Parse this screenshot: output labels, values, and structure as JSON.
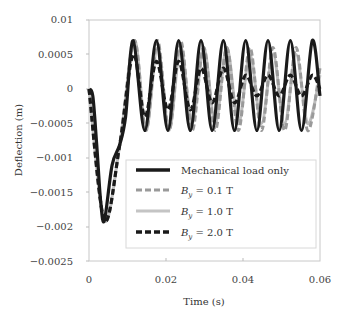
{
  "chart_data": {
    "type": "line",
    "title": "",
    "xlabel": "Time (s)",
    "ylabel": "Deflection (m)",
    "xlim": [
      0,
      0.06
    ],
    "ylim": [
      -0.0025,
      0.001
    ],
    "x_ticks": [
      "0",
      "0.02",
      "0.04",
      "0.06"
    ],
    "y_ticks": [
      "0.01",
      "0.0005",
      "0",
      "−0.0005",
      "−0.001",
      "−0.0015",
      "−0.002",
      "−0.0025"
    ],
    "grid": false,
    "legend_position": "lower right (inside plot)",
    "series": [
      {
        "name": "Mechanical load only",
        "style": "solid",
        "color": "#1a1a1a",
        "description": "Initial drop to about -0.0019 at t≈0.004, then steady oscillation between ≈+0.0007 and ≈-0.0006 with period ≈0.0058 s",
        "x": [
          0,
          0.001,
          0.002,
          0.003,
          0.004,
          0.006,
          0.008,
          0.0095,
          0.0115,
          0.0145,
          0.0175,
          0.0205,
          0.0233,
          0.0263,
          0.0291,
          0.032,
          0.0349,
          0.0378,
          0.0407,
          0.0436,
          0.0465,
          0.0494,
          0.0523,
          0.0552,
          0.058,
          0.06
        ],
        "values": [
          0,
          -0.0001,
          -0.0008,
          -0.0016,
          -0.0019,
          -0.0011,
          -0.0008,
          -0.0004,
          0.0007,
          -0.0006,
          0.0007,
          -0.0006,
          0.0007,
          -0.0006,
          0.0007,
          -0.0006,
          0.0007,
          -0.0006,
          0.0007,
          -0.0006,
          0.0007,
          -0.0006,
          0.0007,
          -0.0006,
          0.0007,
          -0.0001
        ]
      },
      {
        "name": "By = 0.1 T",
        "style": "dashed",
        "color": "#9a9a9a",
        "description": "Nearly coincides with mechanical load only, slight phase lag at later times",
        "x": [
          0,
          0.004,
          0.008,
          0.0118,
          0.0148,
          0.0178,
          0.0208,
          0.0238,
          0.0268,
          0.0298,
          0.0328,
          0.0358,
          0.0388,
          0.0418,
          0.0448,
          0.0478,
          0.0508,
          0.0538,
          0.0568,
          0.06
        ],
        "values": [
          0,
          -0.0019,
          -0.0008,
          0.0007,
          -0.0006,
          0.0007,
          -0.0006,
          0.0007,
          -0.0006,
          0.0006,
          -0.0006,
          0.0006,
          -0.0006,
          0.0006,
          -0.0006,
          0.0006,
          -0.0006,
          0.0006,
          -0.0006,
          0.0003
        ]
      },
      {
        "name": "By = 1.0 T",
        "style": "solid",
        "color": "#bdbdbd",
        "description": "Similar to 0.1 T, slightly damped amplitude",
        "x": [
          0,
          0.004,
          0.008,
          0.0118,
          0.0148,
          0.0178,
          0.0208,
          0.0238,
          0.0268,
          0.0298,
          0.0328,
          0.0358,
          0.0388,
          0.0418,
          0.0448,
          0.0478,
          0.0508,
          0.0538,
          0.0568,
          0.06
        ],
        "values": [
          0,
          -0.0019,
          -0.0008,
          0.0007,
          -0.0006,
          0.0006,
          -0.0006,
          0.0006,
          -0.0005,
          0.0006,
          -0.0005,
          0.0006,
          -0.0005,
          0.0005,
          -0.0005,
          0.0005,
          -0.0005,
          0.0005,
          -0.0005,
          0.0002
        ]
      },
      {
        "name": "By = 2.0 T",
        "style": "dashed",
        "color": "#1a1a1a",
        "description": "Strongly damped oscillation, amplitude decays toward ≈+0.0002/-0.0001 by t=0.06",
        "x": [
          0,
          0.004,
          0.008,
          0.0115,
          0.0145,
          0.0175,
          0.0205,
          0.0233,
          0.0263,
          0.0291,
          0.032,
          0.0349,
          0.0378,
          0.0407,
          0.0436,
          0.0465,
          0.0494,
          0.0523,
          0.0552,
          0.058,
          0.06
        ],
        "values": [
          0,
          -0.0019,
          -0.0008,
          0.0005,
          -0.0004,
          0.0004,
          -0.0003,
          0.0004,
          -0.0003,
          0.0003,
          -0.0002,
          0.0003,
          -0.0002,
          0.0002,
          -0.0001,
          0.0002,
          -0.0001,
          0.0002,
          -0.0001,
          0.0002,
          0.0
        ]
      }
    ]
  },
  "legend": {
    "items": [
      {
        "label": "Mechanical load only"
      },
      {
        "label_main": "B",
        "label_sub": "y",
        "label_rest": " = 0.1 T"
      },
      {
        "label_main": "B",
        "label_sub": "y",
        "label_rest": " = 1.0 T"
      },
      {
        "label_main": "B",
        "label_sub": "y",
        "label_rest": " = 2.0 T"
      }
    ]
  },
  "colors": {
    "axis": "#bbbbbb",
    "black_line": "#1a1a1a",
    "gray_dashed": "#9a9a9a",
    "light_gray": "#c4c4c4"
  }
}
